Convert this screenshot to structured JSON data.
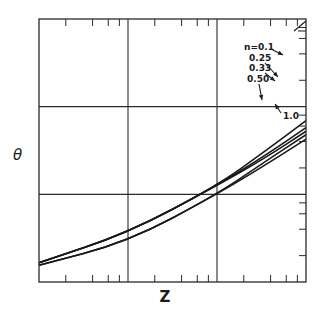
{
  "chart_data": {
    "type": "line",
    "title": "",
    "xlabel": "Z",
    "ylabel": "θ",
    "xscale": "log",
    "yscale": "log",
    "x_decades": 3,
    "y_decades": 3,
    "grid": true,
    "tick_labels_shown": false,
    "legend": "annotated-arrows top-right",
    "series": [
      {
        "name": "n=0.1",
        "label": "n=0.1",
        "points": [
          [
            0.0,
            0.22
          ],
          [
            1.0,
            0.56
          ],
          [
            2.0,
            1.1
          ],
          [
            2.55,
            1.5
          ],
          [
            3.0,
            1.84
          ]
        ]
      },
      {
        "name": "0.25",
        "label": "0.25",
        "points": [
          [
            0.0,
            0.22
          ],
          [
            1.0,
            0.56
          ],
          [
            2.0,
            1.1
          ],
          [
            2.55,
            1.45
          ],
          [
            3.0,
            1.76
          ]
        ]
      },
      {
        "name": "0.33",
        "label": "0.33",
        "points": [
          [
            0.0,
            0.22
          ],
          [
            1.0,
            0.56
          ],
          [
            2.0,
            1.1
          ],
          [
            2.55,
            1.42
          ],
          [
            3.0,
            1.72
          ]
        ]
      },
      {
        "name": "0.50",
        "label": "0.50",
        "points": [
          [
            0.0,
            0.19
          ],
          [
            1.0,
            0.46
          ],
          [
            2.0,
            1.0
          ],
          [
            2.55,
            1.38
          ],
          [
            3.0,
            1.68
          ]
        ]
      },
      {
        "name": "1.0",
        "label": "1.0",
        "points": [
          [
            0.0,
            0.19
          ],
          [
            1.0,
            0.46
          ],
          [
            2.0,
            1.0
          ],
          [
            2.55,
            1.34
          ],
          [
            3.0,
            1.63
          ]
        ]
      }
    ],
    "note": "Coordinates are in decades across the frame (x: 0–3, y: 0–3); axis values are not printed."
  }
}
